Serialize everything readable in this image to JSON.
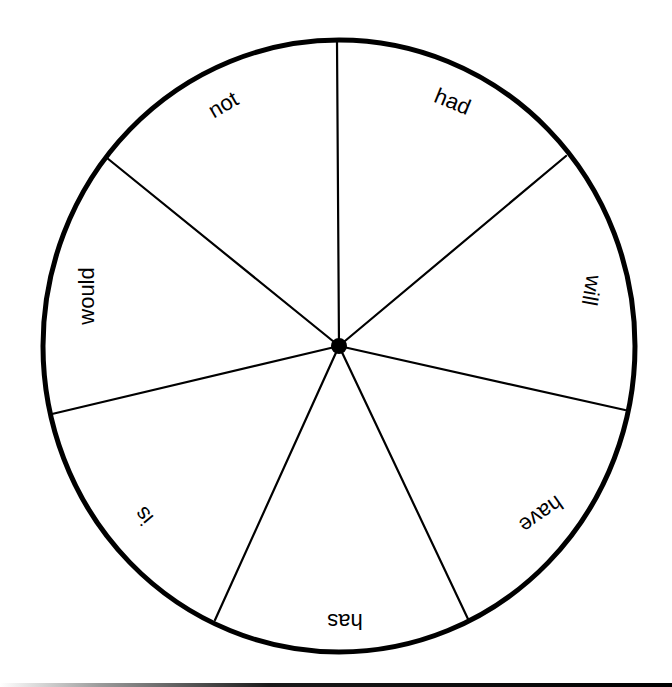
{
  "wheel": {
    "center": {
      "x": 339,
      "y": 346
    },
    "radius_x": 296,
    "radius_y": 306,
    "rim_color": "#000000",
    "spoke_color": "#000000",
    "sector_count": 7,
    "sectors": [
      {
        "label": "had",
        "x": 452,
        "y": 103,
        "rotate": 22
      },
      {
        "label": "will",
        "x": 590,
        "y": 290,
        "rotate": 100
      },
      {
        "label": "have",
        "x": 540,
        "y": 513,
        "rotate": 145
      },
      {
        "label": "has",
        "x": 345,
        "y": 620,
        "rotate": 180
      },
      {
        "label": "is",
        "x": 145,
        "y": 515,
        "rotate": -130
      },
      {
        "label": "would",
        "x": 88,
        "y": 296,
        "rotate": -90
      },
      {
        "label": "not",
        "x": 224,
        "y": 106,
        "rotate": -30
      }
    ],
    "spoke_endpoints": [
      {
        "x": 337,
        "y": 40
      },
      {
        "x": 567,
        "y": 155
      },
      {
        "x": 626,
        "y": 411
      },
      {
        "x": 468,
        "y": 620
      },
      {
        "x": 215,
        "y": 621
      },
      {
        "x": 51,
        "y": 415
      },
      {
        "x": 106,
        "y": 158
      }
    ]
  }
}
